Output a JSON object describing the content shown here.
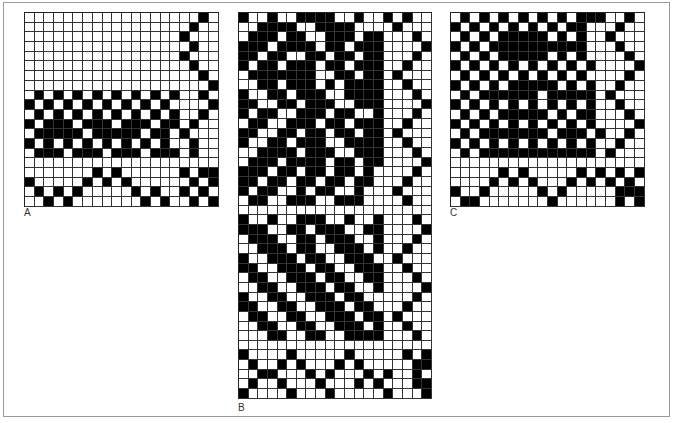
{
  "figure": {
    "panels": [
      {
        "id": "A",
        "label": "A",
        "cols": 20,
        "rows": [
          "00000000000000000010",
          "00000000000000000100",
          "00000000000000001000",
          "00000000000000000100",
          "00000000000000001000",
          "00000000000000000100",
          "00000000000000000010",
          "00000000000000000001",
          "01010101010101010010",
          "10101010101010100001",
          "01010101010101010010",
          "10111011101110110100",
          "01111101111101101000",
          "10101010101010100100",
          "01110111011101110100",
          "00000000000000000000",
          "00000001010000001011",
          "10000010101000000101",
          "01010100000101001010",
          "00101000000010100101"
        ]
      },
      {
        "id": "B",
        "label": "B",
        "cols": 20,
        "rows": [
          "10010011110010010100",
          "00111100111100001000",
          "01110110011101100010",
          "11101111011011100001",
          "11011001101101100010",
          "10110111011011100100",
          "01111111001101101000",
          "00110111010111100100",
          "10011011100111100010",
          "11001101110011100001",
          "10110011101100100010",
          "01100111011011100100",
          "11001101101101101000",
          "10011011100111100100",
          "00111101110011100010",
          "01110111101101100001",
          "11101101101101000010",
          "11011011011011000100",
          "10110010110010001000",
          "01100111001110000100",
          "00000000000000000000",
          "10010011100100100010",
          "11100110111001100001",
          "01110011011100100010",
          "00111011001110100100",
          "10011101100111001000",
          "11001110110011100100",
          "01100111011001100010",
          "00110011101100100001",
          "10011001110110000010",
          "11001100111011000100",
          "01100110011101101000",
          "00110011001110100100",
          "00011001100111100010",
          "00000000000000000000",
          "10000100000100000101",
          "01001010001010000011",
          "00110001010001010010",
          "01001000100010100011",
          "10000100010000010001"
        ]
      },
      {
        "id": "C",
        "label": "C",
        "cols": 20,
        "rows": [
          "01010101010101110010",
          "10101010101011000100",
          "01010111110101001000",
          "10101111111111000100",
          "01010111110101000010",
          "10101010101010100001",
          "01010101010101000010",
          "10101011111010100100",
          "01011111101111101000",
          "10101010101010100100",
          "01010111110101100010",
          "10101010101010100001",
          "01011111110111010010",
          "10101010101010100100",
          "01011111111111101000",
          "00000000000000000000",
          "00000101000001010101",
          "00001010100010101010",
          "10010000010100000111",
          "01100000001000000101"
        ]
      }
    ]
  }
}
